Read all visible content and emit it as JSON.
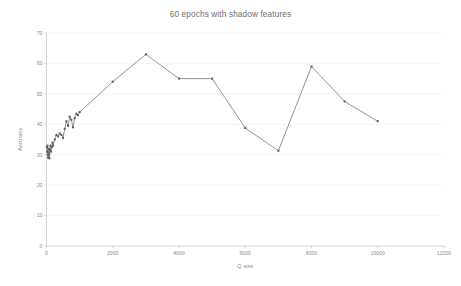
{
  "chart_data": {
    "type": "line",
    "title": "60 epochs with shadow features",
    "xlabel": "Q size",
    "ylabel": "Accuracy",
    "xlim": [
      0,
      12000
    ],
    "ylim": [
      0,
      70
    ],
    "xticks": [
      0,
      2000,
      4000,
      6000,
      8000,
      10000,
      12000
    ],
    "yticks": [
      0,
      10,
      20,
      30,
      40,
      50,
      60,
      70
    ],
    "xtick_labels": [
      "0",
      "2000",
      "4000",
      "6000",
      "8000",
      "10000",
      "12000"
    ],
    "ytick_labels": [
      "0",
      "10",
      "20",
      "30",
      "40",
      "50",
      "60",
      "70"
    ],
    "grid": true,
    "legend": null,
    "marker": "square",
    "line_color": "#808080",
    "marker_color": "#5a5a5a",
    "series": [
      {
        "name": "Accuracy",
        "x": [
          10,
          20,
          30,
          40,
          50,
          60,
          70,
          80,
          90,
          100,
          120,
          140,
          160,
          180,
          200,
          250,
          300,
          350,
          400,
          450,
          500,
          550,
          600,
          650,
          700,
          750,
          800,
          850,
          900,
          950,
          1000,
          2000,
          3000,
          4000,
          5000,
          6000,
          7000,
          8000,
          9000,
          10000
        ],
        "y": [
          32.5,
          31.0,
          33.0,
          30.0,
          29.0,
          30.5,
          32.0,
          30.0,
          28.8,
          31.5,
          33.0,
          31.0,
          32.5,
          34.0,
          33.0,
          35.0,
          36.5,
          36.0,
          37.0,
          36.5,
          35.5,
          38.5,
          41.0,
          39.5,
          42.5,
          41.5,
          39.0,
          42.0,
          43.5,
          43.0,
          44.0,
          54.0,
          63.0,
          55.0,
          55.0,
          38.8,
          31.3,
          59.0,
          47.5,
          41.0
        ]
      }
    ]
  },
  "axis_titles": {
    "x": "Q size",
    "y": "Accuracy"
  }
}
